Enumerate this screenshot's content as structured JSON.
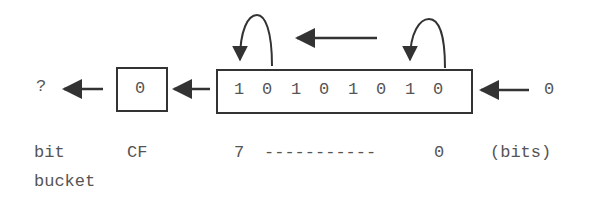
{
  "diagram": {
    "type": "shift-left illustration",
    "bit_bucket_symbol": "?",
    "carry_flag": {
      "value": "0",
      "label": "CF"
    },
    "register": {
      "bits": [
        "1",
        "0",
        "1",
        "0",
        "1",
        "0",
        "1",
        "0"
      ],
      "high_index": "7",
      "low_index": "0",
      "dashes": "-----------",
      "unit": "(bits)"
    },
    "shift_in_value": "0",
    "labels": {
      "bit": "bit",
      "bucket": "bucket"
    }
  }
}
